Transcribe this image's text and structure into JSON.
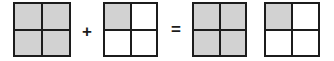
{
  "figure": {
    "background_color": "#ffffff",
    "shade_color": "#d2d2d2",
    "line_color": "#1c1c1c",
    "equation_text": "1 + 1/4 = 1 1/4",
    "items": [
      {
        "id": "square-1",
        "role": "addend",
        "rows": 2,
        "columns": 2,
        "shaded_count": 4,
        "total_count": 4,
        "value_label": "4/4",
        "cells": [
          {
            "position": "top-left",
            "shaded": true
          },
          {
            "position": "top-right",
            "shaded": true
          },
          {
            "position": "bottom-left",
            "shaded": true
          },
          {
            "position": "bottom-right",
            "shaded": true
          }
        ]
      },
      {
        "id": "operator-plus",
        "role": "operator",
        "symbol": "+"
      },
      {
        "id": "square-2",
        "role": "addend",
        "rows": 2,
        "columns": 2,
        "shaded_count": 1,
        "total_count": 4,
        "value_label": "1/4",
        "cells": [
          {
            "position": "top-left",
            "shaded": true
          },
          {
            "position": "top-right",
            "shaded": false
          },
          {
            "position": "bottom-left",
            "shaded": false
          },
          {
            "position": "bottom-right",
            "shaded": false
          }
        ]
      },
      {
        "id": "operator-equals",
        "role": "operator",
        "symbol": "="
      },
      {
        "id": "square-3",
        "role": "sum",
        "rows": 2,
        "columns": 2,
        "shaded_count": 4,
        "total_count": 4,
        "value_label": "4/4",
        "cells": [
          {
            "position": "top-left",
            "shaded": true
          },
          {
            "position": "top-right",
            "shaded": true
          },
          {
            "position": "bottom-left",
            "shaded": true
          },
          {
            "position": "bottom-right",
            "shaded": true
          }
        ]
      },
      {
        "id": "square-4",
        "role": "sum",
        "rows": 2,
        "columns": 2,
        "shaded_count": 1,
        "total_count": 4,
        "value_label": "1/4",
        "cells": [
          {
            "position": "top-left",
            "shaded": true
          },
          {
            "position": "top-right",
            "shaded": false
          },
          {
            "position": "bottom-left",
            "shaded": false
          },
          {
            "position": "bottom-right",
            "shaded": false
          }
        ]
      }
    ]
  }
}
